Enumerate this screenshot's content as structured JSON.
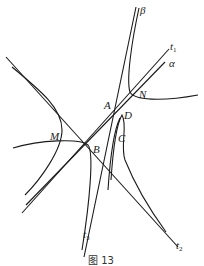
{
  "figure": {
    "caption": "图 13",
    "points": {
      "A": "A",
      "B": "B",
      "C": "C",
      "D": "D",
      "M": "M",
      "N": "N"
    },
    "lines": {
      "t1": {
        "name": "t",
        "sub": "1"
      },
      "t2": {
        "name": "t",
        "sub": "2"
      },
      "t3": {
        "name": "t",
        "sub": "3"
      },
      "alpha": {
        "name": "α"
      },
      "beta": {
        "name": "β"
      }
    }
  }
}
